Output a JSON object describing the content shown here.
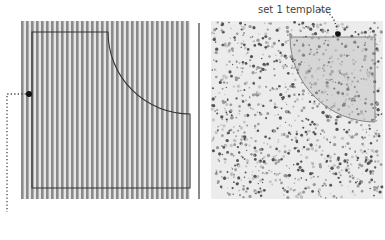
{
  "figure": {
    "annotations": [
      {
        "id": "set1-template",
        "text": "set 1 template"
      }
    ],
    "panels": [
      {
        "id": "left",
        "texture": "vertical-stripes",
        "description": "striped fabric with template outline"
      },
      {
        "id": "right",
        "texture": "speckled-dots",
        "description": "speckled fabric with shaded template region"
      }
    ],
    "colors": {
      "stripe_dark": "#8a8a8a",
      "stripe_light": "#e6e6e6",
      "outline": "#333333",
      "speckle_bg": "#ececec",
      "speckle_dark": "#555555",
      "speckle_mid": "#9a9a9a",
      "template_shade": "#bdbdbd",
      "marker": "#111111",
      "leader": "#444444"
    }
  }
}
